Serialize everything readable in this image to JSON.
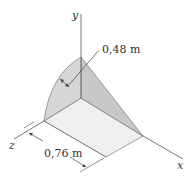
{
  "axes": {
    "x": "x",
    "y": "y",
    "z": "z"
  },
  "dimensions": {
    "radius": "0,48 m",
    "length": "0,76 m"
  },
  "colors": {
    "curved_face": "#d4d4d4",
    "triangle_face": "#c4c4c4",
    "bottom_face": "#eeeeee",
    "lines": "#555555"
  }
}
